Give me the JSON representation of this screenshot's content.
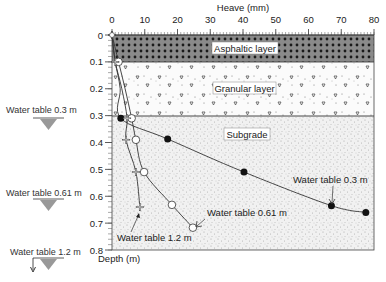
{
  "chart_data": {
    "type": "line",
    "title": "",
    "xlabel": "Heave (mm)",
    "ylabel": "Depth (m)",
    "xlim": [
      0,
      80
    ],
    "ylim": [
      0,
      0.8
    ],
    "x_ticks": [
      "0",
      "10",
      "20",
      "30",
      "40",
      "50",
      "60",
      "70",
      "80"
    ],
    "y_ticks": [
      "0",
      "0.1",
      "0.2",
      "0.3",
      "0.4",
      "0.5",
      "0.6",
      "0.7",
      "0.8"
    ],
    "layers": [
      {
        "name": "Asphaltic layer",
        "depth_from": 0,
        "depth_to": 0.1
      },
      {
        "name": "Granular layer",
        "depth_from": 0.1,
        "depth_to": 0.3
      },
      {
        "name": "Subgrade",
        "depth_from": 0.3,
        "depth_to": 0.8
      }
    ],
    "series": [
      {
        "name": "Water table 0.3 m",
        "marker": "filled-circle",
        "points": [
          [
            0,
            0
          ],
          [
            1,
            0.1
          ],
          [
            2.5,
            0.2
          ],
          [
            2.7,
            0.31
          ],
          [
            17,
            0.387
          ],
          [
            40.3,
            0.51
          ],
          [
            67,
            0.635
          ],
          [
            77.5,
            0.66
          ]
        ]
      },
      {
        "name": "Water table 0.61 m",
        "marker": "open-circle",
        "points": [
          [
            0,
            0
          ],
          [
            2,
            0.1
          ],
          [
            4,
            0.2
          ],
          [
            6,
            0.31
          ],
          [
            7.3,
            0.39
          ],
          [
            9.8,
            0.51
          ],
          [
            18.3,
            0.632
          ],
          [
            24.7,
            0.717
          ]
        ]
      },
      {
        "name": "Water table 1.2 m",
        "marker": "cross",
        "points": [
          [
            0,
            0
          ],
          [
            1,
            0.1
          ],
          [
            3,
            0.2
          ],
          [
            4.6,
            0.31
          ],
          [
            4.3,
            0.39
          ],
          [
            7.3,
            0.51
          ],
          [
            8.5,
            0.64
          ]
        ]
      }
    ],
    "annotations": [
      "Water table 0.3 m",
      "Water table 0.61 m",
      "Water table 1.2 m"
    ],
    "legend_position": "left-side water table markers",
    "grid": false
  },
  "labels": {
    "xlabel": "Heave (mm)",
    "ylabel": "Depth (m)",
    "layer_asphalt": "Asphaltic layer",
    "layer_granular": "Granular layer",
    "layer_subgrade": "Subgrade",
    "wt03_side": "Water table 0.3 m",
    "wt061_side": "Water table 0.61 m",
    "wt12_side": "Water table 1.2 m",
    "wt03_note": "Water table 0.3 m",
    "wt061_note": "Water table 0.61 m",
    "wt12_note": "Water table 1.2 m"
  }
}
